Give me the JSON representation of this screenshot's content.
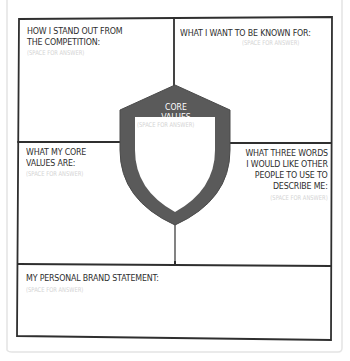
{
  "worksheet": {
    "placeholder": "(SPACE FOR ANSWER)",
    "sections": {
      "stand_out": {
        "title_line1": "HOW I STAND OUT FROM",
        "title_line2": "THE COMPETITION:",
        "hint": "(SPACE FOR ANSWER)"
      },
      "known_for": {
        "title": "WHAT I WANT TO BE KNOWN FOR:",
        "hint": "(SPACE FOR ANSWER)"
      },
      "core_values_shield": {
        "title": "CORE VALUES",
        "hint": "(SPACE FOR ANSWER)"
      },
      "my_core_values": {
        "title_line1": "WHAT MY CORE",
        "title_line2": "VALUES ARE:",
        "hint": "(SPACE FOR ANSWER)"
      },
      "three_words": {
        "title_line1": "WHAT THREE WORDS",
        "title_line2": "I WOULD LIKE OTHER",
        "title_line3": "PEOPLE TO USE TO",
        "title_line4": "DESCRIBE ME:",
        "hint": "(SPACE FOR ANSWER)"
      },
      "brand_statement": {
        "title": "MY PERSONAL BRAND STATEMENT:",
        "hint": "(SPACE FOR ANSWER)"
      }
    },
    "colors": {
      "line": "#2f2f2f",
      "shield": "#5a5a5a",
      "hint": "#d4d4d4",
      "paper_edge": "#e6e6e6"
    }
  }
}
